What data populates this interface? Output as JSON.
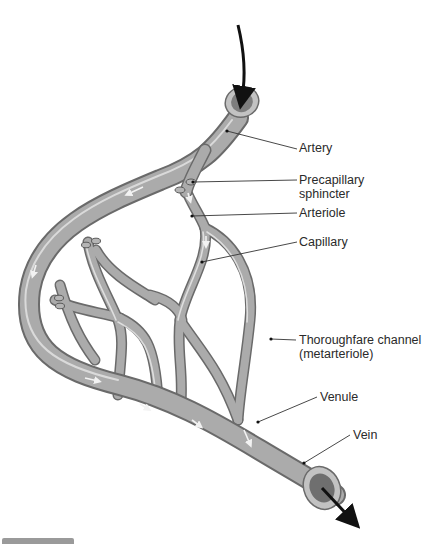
{
  "figure": {
    "type": "capillary bed anatomy illustration",
    "colors": {
      "vessel_fill": "#a9a9a9",
      "vessel_edge": "#6a6a6a",
      "vessel_highlight": "#e6e6e6",
      "lumen": "#7d7d7d",
      "arrow": "#111111",
      "leader_line": "#333333",
      "text": "#2a2a2a"
    },
    "flow": {
      "in_arrow": "flow-into-artery",
      "out_arrow": "flow-out-of-vein"
    }
  },
  "labels": [
    {
      "id": "artery",
      "text": "Artery"
    },
    {
      "id": "precapillary",
      "line1": "Precapillary",
      "line2": "sphincter"
    },
    {
      "id": "arteriole",
      "text": "Arteriole"
    },
    {
      "id": "capillary",
      "text": "Capillary"
    },
    {
      "id": "thoroughfare",
      "line1": "Thoroughfare channel",
      "line2": "(metarteriole)"
    },
    {
      "id": "venule",
      "text": "Venule"
    },
    {
      "id": "vein",
      "text": "Vein"
    }
  ]
}
